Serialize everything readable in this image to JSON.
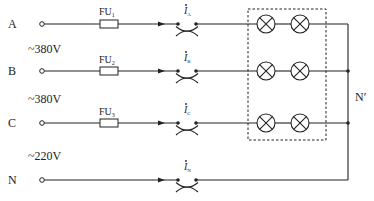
{
  "diagram": {
    "type": "three-phase four-wire lighting circuit",
    "lines": [
      {
        "id": "A",
        "label": "A",
        "fuse": "FU",
        "fuse_sub": "1",
        "current": "I",
        "current_sub": "A"
      },
      {
        "id": "B",
        "label": "B",
        "fuse": "FU",
        "fuse_sub": "2",
        "current": "I",
        "current_sub": "B"
      },
      {
        "id": "C",
        "label": "C",
        "fuse": "FU",
        "fuse_sub": "3",
        "current": "I",
        "current_sub": "C"
      },
      {
        "id": "N",
        "label": "N",
        "current": "I",
        "current_sub": "N"
      }
    ],
    "voltages": [
      {
        "label": "~380V"
      },
      {
        "label": "~380V"
      },
      {
        "label": "~220V"
      }
    ],
    "neutral_point": {
      "label": "N′"
    },
    "lamps_per_phase": 2,
    "colors": {
      "stroke": "#222222",
      "background": "#ffffff"
    }
  }
}
